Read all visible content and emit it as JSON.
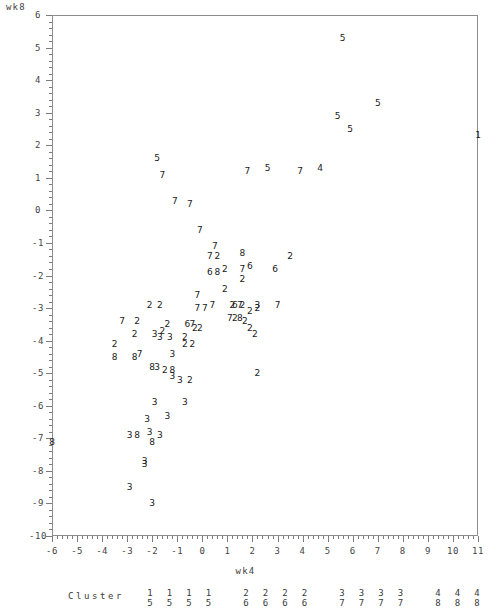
{
  "chart_data": {
    "type": "scatter",
    "title": "",
    "xlabel": "wk4",
    "ylabel": "wk8",
    "xlim": [
      -6,
      11
    ],
    "ylim": [
      -10,
      6
    ],
    "grid": false,
    "legend_position": "below-axis",
    "xticks": [
      -6,
      -5,
      -4,
      -3,
      -2,
      -1,
      0,
      1,
      2,
      3,
      4,
      5,
      6,
      7,
      8,
      9,
      10,
      11
    ],
    "yticks": [
      6,
      5,
      4,
      3,
      2,
      1,
      0,
      -1,
      -2,
      -3,
      -4,
      -5,
      -6,
      -7,
      -8,
      -9,
      -10
    ],
    "xtick_labels": [
      "-6",
      "-5",
      "-4",
      "-3",
      "-2",
      "-1",
      "0",
      "1",
      "2",
      "3",
      "4",
      "5",
      "6",
      "7",
      "8",
      "9",
      "10",
      "11"
    ],
    "ytick_labels": [
      "6",
      "5",
      "4",
      "3",
      "2",
      "1",
      "0",
      "-1",
      "-2",
      "-3",
      "-4",
      "-5",
      "-6",
      "-7",
      "-8",
      "-9",
      "-10"
    ],
    "point_label_field": "cluster",
    "note": "Each plotted glyph is the cluster number of that observation.",
    "points": [
      {
        "x": 5.6,
        "y": 5.3,
        "label": "5"
      },
      {
        "x": 7.0,
        "y": 3.3,
        "label": "5"
      },
      {
        "x": 5.4,
        "y": 2.9,
        "label": "5"
      },
      {
        "x": 5.9,
        "y": 2.5,
        "label": "5"
      },
      {
        "x": 11.0,
        "y": 2.3,
        "label": "1"
      },
      {
        "x": -1.8,
        "y": 1.6,
        "label": "5"
      },
      {
        "x": -1.6,
        "y": 1.1,
        "label": "7"
      },
      {
        "x": 1.8,
        "y": 1.2,
        "label": "7"
      },
      {
        "x": 2.6,
        "y": 1.3,
        "label": "5"
      },
      {
        "x": 3.9,
        "y": 1.2,
        "label": "7"
      },
      {
        "x": 4.7,
        "y": 1.3,
        "label": "4"
      },
      {
        "x": -1.1,
        "y": 0.3,
        "label": "7"
      },
      {
        "x": -0.5,
        "y": 0.2,
        "label": "7"
      },
      {
        "x": -0.1,
        "y": -0.6,
        "label": "7"
      },
      {
        "x": 0.5,
        "y": -1.1,
        "label": "7"
      },
      {
        "x": 0.3,
        "y": -1.4,
        "label": "7"
      },
      {
        "x": 0.6,
        "y": -1.4,
        "label": "2"
      },
      {
        "x": 1.6,
        "y": -1.3,
        "label": "8"
      },
      {
        "x": 3.5,
        "y": -1.4,
        "label": "2"
      },
      {
        "x": 0.3,
        "y": -1.9,
        "label": "6"
      },
      {
        "x": 0.6,
        "y": -1.9,
        "label": "8"
      },
      {
        "x": 0.9,
        "y": -1.8,
        "label": "2"
      },
      {
        "x": 1.6,
        "y": -1.8,
        "label": "7"
      },
      {
        "x": 1.9,
        "y": -1.7,
        "label": "6"
      },
      {
        "x": 1.6,
        "y": -2.1,
        "label": "2"
      },
      {
        "x": 2.9,
        "y": -1.8,
        "label": "6"
      },
      {
        "x": -2.1,
        "y": -2.9,
        "label": "2"
      },
      {
        "x": -1.7,
        "y": -2.9,
        "label": "2"
      },
      {
        "x": -0.2,
        "y": -2.6,
        "label": "7"
      },
      {
        "x": 0.9,
        "y": -2.4,
        "label": "2"
      },
      {
        "x": 0.4,
        "y": -2.9,
        "label": "7"
      },
      {
        "x": -0.2,
        "y": -3.0,
        "label": "7"
      },
      {
        "x": 0.1,
        "y": -3.0,
        "label": "7"
      },
      {
        "x": 1.2,
        "y": -2.9,
        "label": "2"
      },
      {
        "x": 1.3,
        "y": -2.9,
        "label": "6"
      },
      {
        "x": 1.5,
        "y": -2.9,
        "label": "7"
      },
      {
        "x": 1.6,
        "y": -2.9,
        "label": "2"
      },
      {
        "x": 2.2,
        "y": -2.9,
        "label": "3"
      },
      {
        "x": 2.2,
        "y": -3.0,
        "label": "2"
      },
      {
        "x": 1.9,
        "y": -3.1,
        "label": "2"
      },
      {
        "x": 3.0,
        "y": -2.9,
        "label": "7"
      },
      {
        "x": -3.2,
        "y": -3.4,
        "label": "7"
      },
      {
        "x": -2.6,
        "y": -3.4,
        "label": "2"
      },
      {
        "x": 1.1,
        "y": -3.3,
        "label": "7"
      },
      {
        "x": 1.3,
        "y": -3.3,
        "label": "2"
      },
      {
        "x": 1.5,
        "y": -3.3,
        "label": "8"
      },
      {
        "x": 1.7,
        "y": -3.4,
        "label": "2"
      },
      {
        "x": -1.4,
        "y": -3.5,
        "label": "2"
      },
      {
        "x": -0.6,
        "y": -3.5,
        "label": "6"
      },
      {
        "x": -0.4,
        "y": -3.5,
        "label": "7"
      },
      {
        "x": -0.3,
        "y": -3.6,
        "label": "2"
      },
      {
        "x": -0.1,
        "y": -3.6,
        "label": "2"
      },
      {
        "x": 1.9,
        "y": -3.6,
        "label": "2"
      },
      {
        "x": -2.7,
        "y": -3.8,
        "label": "2"
      },
      {
        "x": -1.9,
        "y": -3.8,
        "label": "3"
      },
      {
        "x": -1.6,
        "y": -3.7,
        "label": "2"
      },
      {
        "x": -1.7,
        "y": -3.9,
        "label": "3"
      },
      {
        "x": -1.3,
        "y": -3.9,
        "label": "3"
      },
      {
        "x": -0.7,
        "y": -3.9,
        "label": "2"
      },
      {
        "x": -0.7,
        "y": -4.1,
        "label": "2"
      },
      {
        "x": -0.4,
        "y": -4.1,
        "label": "2"
      },
      {
        "x": 2.1,
        "y": -3.8,
        "label": "2"
      },
      {
        "x": -3.5,
        "y": -4.1,
        "label": "2"
      },
      {
        "x": -3.5,
        "y": -4.5,
        "label": "8"
      },
      {
        "x": -2.7,
        "y": -4.5,
        "label": "8"
      },
      {
        "x": -2.5,
        "y": -4.4,
        "label": "7"
      },
      {
        "x": -1.2,
        "y": -4.4,
        "label": "3"
      },
      {
        "x": -2.0,
        "y": -4.8,
        "label": "8"
      },
      {
        "x": -1.8,
        "y": -4.8,
        "label": "3"
      },
      {
        "x": -1.5,
        "y": -4.9,
        "label": "2"
      },
      {
        "x": -1.2,
        "y": -4.9,
        "label": "8"
      },
      {
        "x": -1.2,
        "y": -5.1,
        "label": "3"
      },
      {
        "x": -0.9,
        "y": -5.2,
        "label": "3"
      },
      {
        "x": -0.5,
        "y": -5.2,
        "label": "2"
      },
      {
        "x": 2.2,
        "y": -5.0,
        "label": "2"
      },
      {
        "x": -1.9,
        "y": -5.9,
        "label": "3"
      },
      {
        "x": -0.7,
        "y": -5.9,
        "label": "3"
      },
      {
        "x": -2.2,
        "y": -6.4,
        "label": "3"
      },
      {
        "x": -1.4,
        "y": -6.3,
        "label": "3"
      },
      {
        "x": -2.9,
        "y": -6.9,
        "label": "3"
      },
      {
        "x": -2.6,
        "y": -6.9,
        "label": "8"
      },
      {
        "x": -2.1,
        "y": -6.8,
        "label": "3"
      },
      {
        "x": -1.7,
        "y": -6.9,
        "label": "3"
      },
      {
        "x": -2.0,
        "y": -7.1,
        "label": "8"
      },
      {
        "x": -6.0,
        "y": -7.1,
        "label": "8"
      },
      {
        "x": -2.3,
        "y": -7.7,
        "label": "3"
      },
      {
        "x": -2.3,
        "y": -7.8,
        "label": "3"
      },
      {
        "x": -2.9,
        "y": -8.5,
        "label": "3"
      },
      {
        "x": -2.0,
        "y": -9.0,
        "label": "3"
      }
    ]
  },
  "legend": {
    "caption": "Cluster",
    "pairs": [
      {
        "top": "1",
        "bottom": "5"
      },
      {
        "top": "1",
        "bottom": "5"
      },
      {
        "top": "1",
        "bottom": "5"
      },
      {
        "top": "1",
        "bottom": "5"
      },
      {
        "top": "2",
        "bottom": "6"
      },
      {
        "top": "2",
        "bottom": "6"
      },
      {
        "top": "2",
        "bottom": "6"
      },
      {
        "top": "2",
        "bottom": "6"
      },
      {
        "top": "3",
        "bottom": "7"
      },
      {
        "top": "3",
        "bottom": "7"
      },
      {
        "top": "3",
        "bottom": "7"
      },
      {
        "top": "3",
        "bottom": "7"
      },
      {
        "top": "4",
        "bottom": "8"
      },
      {
        "top": "4",
        "bottom": "8"
      },
      {
        "top": "4",
        "bottom": "8"
      },
      {
        "top": "4",
        "bottom": "8"
      }
    ]
  }
}
